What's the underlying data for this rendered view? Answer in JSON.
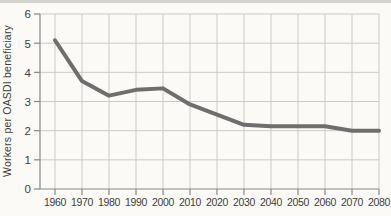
{
  "page": {
    "background": "#fbfaf7",
    "edge_band": "#d5d2cd"
  },
  "chart_data": {
    "type": "line",
    "title": "",
    "xlabel": "",
    "ylabel": "Workers per OASDI beneficiary",
    "x": [
      1960,
      1970,
      1980,
      1990,
      2000,
      2010,
      2020,
      2030,
      2040,
      2050,
      2060,
      2070,
      2080
    ],
    "series": [
      {
        "name": "Workers per OASDI beneficiary",
        "values": [
          5.1,
          3.7,
          3.2,
          3.4,
          3.45,
          2.9,
          2.55,
          2.2,
          2.15,
          2.15,
          2.15,
          2.0,
          2.0
        ]
      }
    ],
    "ylim": [
      0,
      6
    ],
    "yticks": [
      0,
      1,
      2,
      3,
      4,
      5,
      6
    ],
    "grid": true,
    "legend": "none",
    "colors": {
      "line": "#6e6e6e",
      "grid": "#cdcac5",
      "axis": "#8b8884",
      "text": "#403e3b"
    }
  }
}
